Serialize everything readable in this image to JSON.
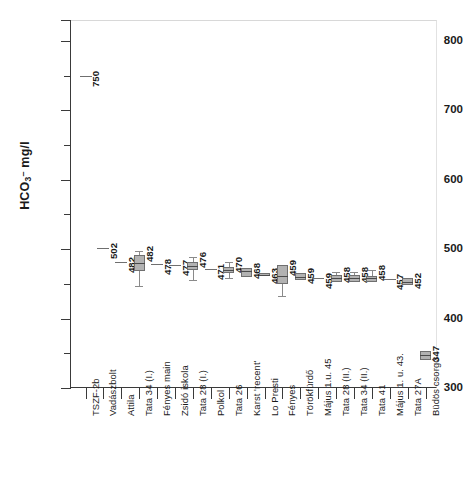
{
  "chart_data": {
    "type": "box",
    "title": "",
    "xlabel": "",
    "ylabel": "HCO3- mg/l",
    "ylabel_parts": {
      "prefix": "HCO",
      "sub": "3",
      "sup": "–",
      "suffix": " mg/l"
    },
    "ylim": [
      300,
      830
    ],
    "yticks_major": [
      300,
      400,
      500,
      600,
      700,
      800
    ],
    "yticks_minor": [
      350,
      450,
      550,
      650,
      750
    ],
    "grid": false,
    "legend": "none",
    "categories": [
      "TSZF-2b",
      "Vadászbolt",
      "Attila",
      "Tata 34 (I.)",
      "Fényes main",
      "Zsidó iskola",
      "Tata 28 (I.)",
      "Polkol",
      "Tata 26",
      "Karst 'recent'",
      "Lo Presti",
      "Fényes",
      "Törökfürdő",
      "Május 1.u. 45",
      "Tata 28 (II.)",
      "Tata 34 (II.)",
      "Tata 41",
      "Május 1. u. 43.",
      "Tata 27A",
      "Büdös csorgó"
    ],
    "values": [
      750,
      502,
      482,
      482,
      478,
      477,
      476,
      471,
      470,
      468,
      463,
      459,
      459,
      459,
      458,
      458,
      458,
      457,
      452,
      347
    ],
    "boxes": [
      {
        "label": "TSZF-2b",
        "value": 750,
        "mark": "dash",
        "median": 750,
        "q1": 750,
        "q3": 750,
        "low": 750,
        "high": 750
      },
      {
        "label": "Vadászbolt",
        "value": 502,
        "mark": "dash",
        "median": 502,
        "q1": 502,
        "q3": 502,
        "low": 502,
        "high": 502
      },
      {
        "label": "Attila",
        "value": 482,
        "mark": "dash",
        "median": 482,
        "q1": 482,
        "q3": 482,
        "low": 482,
        "high": 482
      },
      {
        "label": "Tata 34 (I.)",
        "value": 482,
        "mark": "box",
        "median": 480,
        "q1": 468,
        "q3": 492,
        "low": 447,
        "high": 498
      },
      {
        "label": "Fényes main",
        "value": 478,
        "mark": "dash",
        "median": 478,
        "q1": 478,
        "q3": 478,
        "low": 478,
        "high": 478
      },
      {
        "label": "Zsidó iskola",
        "value": 477,
        "mark": "dash",
        "median": 477,
        "q1": 477,
        "q3": 477,
        "low": 477,
        "high": 477
      },
      {
        "label": "Tata 28 (I.)",
        "value": 476,
        "mark": "box",
        "median": 476,
        "q1": 470,
        "q3": 481,
        "low": 455,
        "high": 488
      },
      {
        "label": "Polkol",
        "value": 471,
        "mark": "dash",
        "median": 471,
        "q1": 471,
        "q3": 471,
        "low": 471,
        "high": 471
      },
      {
        "label": "Tata 26",
        "value": 470,
        "mark": "box",
        "median": 470,
        "q1": 465,
        "q3": 474,
        "low": 458,
        "high": 481
      },
      {
        "label": "Karst 'recent'",
        "value": 468,
        "mark": "box",
        "median": 468,
        "q1": 460,
        "q3": 473,
        "low": 460,
        "high": 473
      },
      {
        "label": "Lo Presti",
        "value": 463,
        "mark": "box",
        "median": 463,
        "q1": 461,
        "q3": 465,
        "low": 461,
        "high": 465
      },
      {
        "label": "Fényes",
        "value": 459,
        "mark": "box",
        "median": 461,
        "q1": 450,
        "q3": 477,
        "low": 433,
        "high": 477
      },
      {
        "label": "Törökfürdő",
        "value": 459,
        "mark": "box",
        "median": 460,
        "q1": 456,
        "q3": 465,
        "low": 456,
        "high": 465
      },
      {
        "label": "Május 1.u. 45",
        "value": 459,
        "mark": "dash",
        "median": 459,
        "q1": 459,
        "q3": 459,
        "low": 459,
        "high": 459
      },
      {
        "label": "Tata 28 (II.)",
        "value": 458,
        "mark": "box",
        "median": 458,
        "q1": 453,
        "q3": 463,
        "low": 453,
        "high": 467
      },
      {
        "label": "Tata 34 (II.)",
        "value": 458,
        "mark": "box",
        "median": 458,
        "q1": 453,
        "q3": 463,
        "low": 453,
        "high": 467
      },
      {
        "label": "Tata 41",
        "value": 458,
        "mark": "box",
        "median": 458,
        "q1": 453,
        "q3": 462,
        "low": 453,
        "high": 470
      },
      {
        "label": "Május 1. u. 43.",
        "value": 457,
        "mark": "dash",
        "median": 457,
        "q1": 457,
        "q3": 457,
        "low": 457,
        "high": 457
      },
      {
        "label": "Tata 27A",
        "value": 452,
        "mark": "box",
        "median": 453,
        "q1": 448,
        "q3": 459,
        "low": 448,
        "high": 459
      },
      {
        "label": "Büdös csorgó",
        "value": 347,
        "mark": "box",
        "median": 347,
        "q1": 341,
        "q3": 354,
        "low": 341,
        "high": 354
      }
    ]
  },
  "colors": {
    "box_fill": "#b2b2b2",
    "box_border": "#6f6f6f",
    "axis": "#3a3a3a",
    "text": "#1a1a1a",
    "background": "#ffffff"
  }
}
